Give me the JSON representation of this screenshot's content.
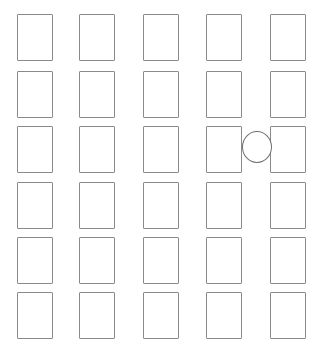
{
  "canvas": {
    "width": 322,
    "height": 350,
    "background_color": "#ffffff"
  },
  "diagram": {
    "type": "grid-layout",
    "title": "",
    "columns": 5,
    "rows": 6,
    "shape_outline_color": "#8a8a8a",
    "shape_fill_color": "#ffffff",
    "cell_width": 36,
    "cell_height": 47,
    "column_x": [
      17,
      79,
      143,
      206,
      270
    ],
    "row_y": [
      14,
      71,
      126,
      182,
      237,
      292
    ],
    "cells": [
      {
        "id": "c1r1",
        "column": 1,
        "row": 1,
        "shape": "rectangle",
        "x": 17,
        "y": 14,
        "w": 36,
        "h": 47,
        "label": ""
      },
      {
        "id": "c1r2",
        "column": 1,
        "row": 2,
        "shape": "rectangle",
        "x": 17,
        "y": 71,
        "w": 36,
        "h": 47,
        "label": ""
      },
      {
        "id": "c1r3",
        "column": 1,
        "row": 3,
        "shape": "rectangle",
        "x": 17,
        "y": 126,
        "w": 36,
        "h": 47,
        "label": ""
      },
      {
        "id": "c1r4",
        "column": 1,
        "row": 4,
        "shape": "rectangle",
        "x": 17,
        "y": 182,
        "w": 36,
        "h": 47,
        "label": ""
      },
      {
        "id": "c1r5",
        "column": 1,
        "row": 5,
        "shape": "rectangle",
        "x": 17,
        "y": 237,
        "w": 36,
        "h": 47,
        "label": ""
      },
      {
        "id": "c1r6",
        "column": 1,
        "row": 6,
        "shape": "rectangle",
        "x": 17,
        "y": 292,
        "w": 36,
        "h": 47,
        "label": ""
      },
      {
        "id": "c2r1",
        "column": 2,
        "row": 1,
        "shape": "rectangle",
        "x": 79,
        "y": 14,
        "w": 36,
        "h": 47,
        "label": ""
      },
      {
        "id": "c2r2",
        "column": 2,
        "row": 2,
        "shape": "rectangle",
        "x": 79,
        "y": 71,
        "w": 36,
        "h": 47,
        "label": ""
      },
      {
        "id": "c2r3",
        "column": 2,
        "row": 3,
        "shape": "rectangle",
        "x": 79,
        "y": 126,
        "w": 36,
        "h": 47,
        "label": ""
      },
      {
        "id": "c2r4",
        "column": 2,
        "row": 4,
        "shape": "rectangle",
        "x": 79,
        "y": 182,
        "w": 36,
        "h": 47,
        "label": ""
      },
      {
        "id": "c2r5",
        "column": 2,
        "row": 5,
        "shape": "rectangle",
        "x": 79,
        "y": 237,
        "w": 36,
        "h": 47,
        "label": ""
      },
      {
        "id": "c2r6",
        "column": 2,
        "row": 6,
        "shape": "rectangle",
        "x": 79,
        "y": 292,
        "w": 36,
        "h": 47,
        "label": ""
      },
      {
        "id": "c3r1",
        "column": 3,
        "row": 1,
        "shape": "rectangle",
        "x": 143,
        "y": 14,
        "w": 36,
        "h": 47,
        "label": ""
      },
      {
        "id": "c3r2",
        "column": 3,
        "row": 2,
        "shape": "rectangle",
        "x": 143,
        "y": 71,
        "w": 36,
        "h": 47,
        "label": ""
      },
      {
        "id": "c3r3",
        "column": 3,
        "row": 3,
        "shape": "rectangle",
        "x": 143,
        "y": 126,
        "w": 36,
        "h": 47,
        "label": ""
      },
      {
        "id": "c3r4",
        "column": 3,
        "row": 4,
        "shape": "rectangle",
        "x": 143,
        "y": 182,
        "w": 36,
        "h": 47,
        "label": ""
      },
      {
        "id": "c3r5",
        "column": 3,
        "row": 5,
        "shape": "rectangle",
        "x": 143,
        "y": 237,
        "w": 36,
        "h": 47,
        "label": ""
      },
      {
        "id": "c3r6",
        "column": 3,
        "row": 6,
        "shape": "rectangle",
        "x": 143,
        "y": 292,
        "w": 36,
        "h": 47,
        "label": ""
      },
      {
        "id": "c4r1",
        "column": 4,
        "row": 1,
        "shape": "rectangle",
        "x": 206,
        "y": 14,
        "w": 36,
        "h": 47,
        "label": ""
      },
      {
        "id": "c4r2",
        "column": 4,
        "row": 2,
        "shape": "rectangle",
        "x": 206,
        "y": 71,
        "w": 36,
        "h": 47,
        "label": ""
      },
      {
        "id": "c4r3",
        "column": 4,
        "row": 3,
        "shape": "rectangle",
        "x": 206,
        "y": 126,
        "w": 36,
        "h": 47,
        "label": ""
      },
      {
        "id": "c4r4",
        "column": 4,
        "row": 4,
        "shape": "rectangle",
        "x": 206,
        "y": 182,
        "w": 36,
        "h": 47,
        "label": ""
      },
      {
        "id": "c4r5",
        "column": 4,
        "row": 5,
        "shape": "rectangle",
        "x": 206,
        "y": 237,
        "w": 36,
        "h": 47,
        "label": ""
      },
      {
        "id": "c4r6",
        "column": 4,
        "row": 6,
        "shape": "rectangle",
        "x": 206,
        "y": 292,
        "w": 36,
        "h": 47,
        "label": ""
      },
      {
        "id": "c5r1",
        "column": 5,
        "row": 1,
        "shape": "rectangle",
        "x": 270,
        "y": 14,
        "w": 36,
        "h": 47,
        "label": ""
      },
      {
        "id": "c5r2",
        "column": 5,
        "row": 2,
        "shape": "rectangle",
        "x": 270,
        "y": 71,
        "w": 36,
        "h": 47,
        "label": ""
      },
      {
        "id": "c5r3",
        "column": 5,
        "row": 3,
        "shape": "rectangle",
        "x": 270,
        "y": 126,
        "w": 36,
        "h": 47,
        "label": ""
      },
      {
        "id": "c5r4",
        "column": 5,
        "row": 4,
        "shape": "rectangle",
        "x": 270,
        "y": 182,
        "w": 36,
        "h": 47,
        "label": ""
      },
      {
        "id": "c5r5",
        "column": 5,
        "row": 5,
        "shape": "rectangle",
        "x": 270,
        "y": 237,
        "w": 36,
        "h": 47,
        "label": ""
      },
      {
        "id": "c5r6",
        "column": 5,
        "row": 6,
        "shape": "rectangle",
        "x": 270,
        "y": 292,
        "w": 36,
        "h": 47,
        "label": ""
      }
    ],
    "markers": [
      {
        "id": "m1",
        "shape": "circle",
        "x": 242,
        "y": 131,
        "w": 30,
        "h": 32,
        "outline_color": "#6f6f6f",
        "fill_color": "#ffffff",
        "label": "",
        "between_columns": [
          4,
          5
        ],
        "row": 3
      }
    ]
  }
}
